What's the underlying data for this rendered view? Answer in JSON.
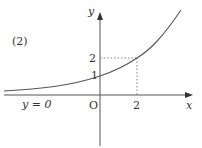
{
  "figure": {
    "label": "(2)",
    "x_axis_label": "x",
    "y_axis_label": "y",
    "origin_label": "O",
    "asymptote_label": "y = 0",
    "x_tick": "2",
    "y_ticks": [
      "1",
      "2"
    ]
  },
  "curve": {
    "function": "y = 2^(x/2)",
    "points": [
      [
        0,
        1
      ],
      [
        2,
        2
      ]
    ],
    "color": "#555555"
  }
}
